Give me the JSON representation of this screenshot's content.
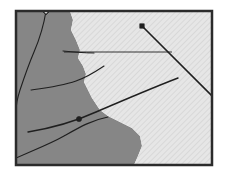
{
  "figure": {
    "title": "",
    "type": "geologic-sketch-map",
    "canvas": {
      "width": 228,
      "height": 176
    },
    "background_color": "#ffffff"
  },
  "frame": {
    "name": "map-border",
    "x": 15,
    "y": 10,
    "width": 198,
    "height": 156,
    "stroke_color": "#2b2b2b",
    "stroke_width": 2.5,
    "fill_color": "#ffffff"
  },
  "regions": [
    {
      "id": "west-unit",
      "label": "",
      "fill_color": "#868686",
      "pattern": "solid",
      "description": "solid medium gray unit occupying the western part of the map",
      "path": "M 16 11 L 70 11 L 73 20 L 71 30 L 76 40 L 80 50 L 78 58 L 83 66 L 86 74 L 84 82 L 88 90 L 92 98 L 96 104 L 100 110 L 108 116 L 120 122 L 132 128 L 140 136 L 142 146 L 138 156 L 134 165 L 16 165 Z"
    },
    {
      "id": "east-unit",
      "label": "",
      "fill_color": "#e3e3e3",
      "pattern": "diagonal-hatch",
      "hatch_color": "#cfcfcf",
      "description": "light gray diagonally hatched unit occupying the eastern part of the map",
      "path": "M 70 11 L 212 11 L 212 165 L 134 165 L 138 156 L 142 146 L 140 136 L 132 128 L 120 122 L 108 116 L 100 110 L 96 104 L 92 98 L 88 90 L 84 82 L 86 74 L 83 66 L 78 58 L 80 50 L 76 40 L 71 30 L 73 20 Z"
    }
  ],
  "lines": [
    {
      "id": "line-north-trunk",
      "name": "north-trending-fault",
      "stroke_color": "#1f1f1f",
      "stroke_width": 1.1,
      "path": "M 46 11 C 44 24 40 38 34 52 C 28 66 24 78 20 90 C 17 99 16 106 16 112"
    },
    {
      "id": "line-mid-branch",
      "name": "mid-branch-fault",
      "stroke_color": "#1f1f1f",
      "stroke_width": 1.1,
      "path": "M 31 90 C 46 88 62 86 76 81 C 88 77 95 72 104 66"
    },
    {
      "id": "line-horizontal-tie",
      "name": "horizontal-marker-line",
      "stroke_color": "#1f1f1f",
      "stroke_width": 0.9,
      "path": "M 64 52 L 172 52"
    },
    {
      "id": "line-ne-descend",
      "name": "northeast-descending-fault",
      "stroke_color": "#1f1f1f",
      "stroke_width": 1.6,
      "path": "M 142 26 L 212 96"
    },
    {
      "id": "line-se-arc",
      "name": "southeast-arcing-fault",
      "stroke_color": "#1f1f1f",
      "stroke_width": 1.4,
      "path": "M 28 132 C 52 128 74 122 96 112 C 124 100 152 88 178 78"
    },
    {
      "id": "line-lower-curve",
      "name": "lower-curving-fault",
      "stroke_color": "#1f1f1f",
      "stroke_width": 1.1,
      "path": "M 16 158 C 34 150 50 144 64 136 C 80 127 92 120 108 117"
    },
    {
      "id": "line-taper-arrow",
      "name": "tapered-lineation",
      "stroke_color": "#1f1f1f",
      "stroke_width": 1.0,
      "path": "M 63 51 C 74 52 84 53 94 53"
    }
  ],
  "markers": [
    {
      "id": "m1",
      "name": "open-circle-marker",
      "shape": "open-circle",
      "x": 46,
      "y": 12,
      "r": 2.0,
      "fill": "#ffffff",
      "stroke": "#1f1f1f"
    },
    {
      "id": "m2",
      "name": "open-circle-marker",
      "shape": "open-circle",
      "x": 61,
      "y": 50,
      "r": 2.4,
      "fill": "#ffffff",
      "stroke": "#1f1f1f"
    },
    {
      "id": "m3",
      "name": "filled-square-marker",
      "shape": "filled-square",
      "x": 142,
      "y": 26,
      "r": 2.2,
      "fill": "#1f1f1f",
      "stroke": "#1f1f1f"
    },
    {
      "id": "m4",
      "name": "filled-circle-marker",
      "shape": "filled-circle",
      "x": 79,
      "y": 119,
      "r": 2.6,
      "fill": "#1f1f1f",
      "stroke": "#1f1f1f"
    },
    {
      "id": "m5",
      "name": "open-circle-marker",
      "shape": "open-circle",
      "x": 69,
      "y": 122,
      "r": 2.2,
      "fill": "#ffffff",
      "stroke": "#1f1f1f"
    },
    {
      "id": "m6",
      "name": "open-circle-marker",
      "shape": "open-circle",
      "x": 51,
      "y": 142,
      "r": 2.2,
      "fill": "#ffffff",
      "stroke": "#1f1f1f"
    }
  ]
}
